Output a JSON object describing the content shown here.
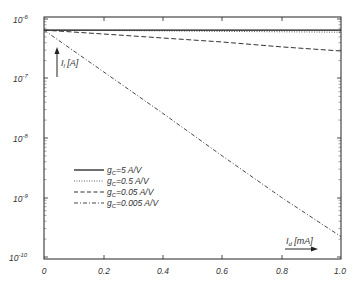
{
  "chart_data": {
    "type": "line",
    "title": "",
    "xlabel": "I_d [mA]",
    "ylabel": "I_l [A]",
    "xscale": "linear",
    "yscale": "log",
    "xlim": [
      0,
      1.0
    ],
    "ylim": [
      1e-10,
      1e-06
    ],
    "x_ticks": [
      "0",
      "0.2",
      "0.4",
      "0.6",
      "0.8",
      "1.0"
    ],
    "y_ticks": [
      "10-6",
      "10-7",
      "10-8",
      "10-9",
      "10-10"
    ],
    "grid": false,
    "legend_position": "center-left",
    "x": [
      0,
      0.2,
      0.4,
      0.6,
      0.8,
      1.0
    ],
    "series": [
      {
        "name": "gc=5 A/V",
        "style": "solid",
        "values": [
          6.5e-07,
          6.5e-07,
          6.5e-07,
          6.5e-07,
          6.5e-07,
          6.5e-07
        ]
      },
      {
        "name": "gc=0.5 A/V",
        "style": "dotted",
        "values": [
          6.5e-07,
          6.4e-07,
          6.3e-07,
          6.2e-07,
          6.1e-07,
          6e-07
        ]
      },
      {
        "name": "gc=0.05 A/V",
        "style": "dashed",
        "values": [
          6.5e-07,
          5.6e-07,
          4.8e-07,
          4.1e-07,
          3.4e-07,
          2.9e-07
        ]
      },
      {
        "name": "gc=0.005 A/V",
        "style": "dashdot",
        "values": [
          6.5e-07,
          1.3e-07,
          2.6e-08,
          5e-09,
          1e-09,
          2.2e-10
        ]
      }
    ]
  },
  "labels": {
    "y_axis": {
      "main": "I",
      "sub": "l",
      "unit": " [A]"
    },
    "x_axis": {
      "main": "I",
      "sub": "d",
      "unit": " [mA]"
    },
    "y_ticks": [
      {
        "base": "10",
        "exp": "-6"
      },
      {
        "base": "10",
        "exp": "-7"
      },
      {
        "base": "10",
        "exp": "-8"
      },
      {
        "base": "10",
        "exp": "-9"
      },
      {
        "base": "10",
        "exp": "-10"
      }
    ],
    "x_ticks": [
      "0",
      "0.2",
      "0.4",
      "0.6",
      "0.8",
      "1.0"
    ],
    "legend": [
      {
        "g": "g",
        "sub": "C",
        "rest": "=5 A/V"
      },
      {
        "g": "g",
        "sub": "C",
        "rest": "=0.5 A/V"
      },
      {
        "g": "g",
        "sub": "C",
        "rest": "=0.05 A/V"
      },
      {
        "g": "g",
        "sub": "C",
        "rest": "=0.005 A/V"
      }
    ]
  }
}
